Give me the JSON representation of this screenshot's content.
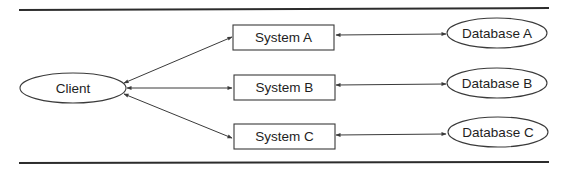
{
  "diagram": {
    "type": "architecture",
    "colors": {
      "stroke": "#3a3a3a",
      "text": "#1e1e1e",
      "background": "#ffffff",
      "rule": "#2c2c2c"
    },
    "nodes": {
      "client": {
        "label": "Client",
        "shape": "ellipse"
      },
      "system_a": {
        "label": "System A",
        "shape": "rectangle"
      },
      "system_b": {
        "label": "System B",
        "shape": "rectangle"
      },
      "system_c": {
        "label": "System C",
        "shape": "rectangle"
      },
      "database_a": {
        "label": "Database A",
        "shape": "ellipse"
      },
      "database_b": {
        "label": "Database B",
        "shape": "ellipse"
      },
      "database_c": {
        "label": "Database C",
        "shape": "ellipse"
      }
    },
    "edges": [
      {
        "from": "client",
        "to": "system_a",
        "direction": "bidirectional"
      },
      {
        "from": "client",
        "to": "system_b",
        "direction": "bidirectional"
      },
      {
        "from": "client",
        "to": "system_c",
        "direction": "bidirectional"
      },
      {
        "from": "system_a",
        "to": "database_a",
        "direction": "bidirectional"
      },
      {
        "from": "system_b",
        "to": "database_b",
        "direction": "bidirectional"
      },
      {
        "from": "system_c",
        "to": "database_c",
        "direction": "bidirectional"
      }
    ]
  }
}
